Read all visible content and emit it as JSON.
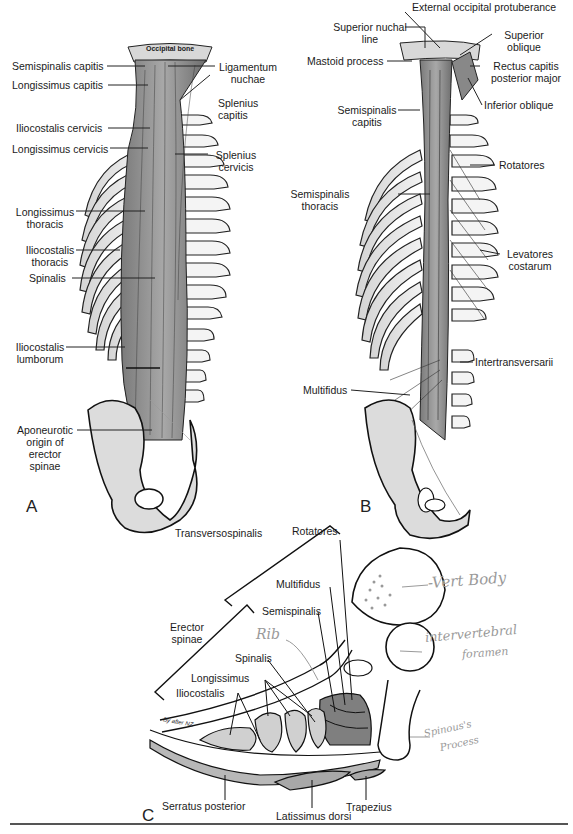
{
  "figure": {
    "panels": [
      {
        "id": "A",
        "letter": "A",
        "view": "posterior, superficial erector spinae",
        "labels": {
          "occipital_bone": "Occipital bone",
          "semispinalis_capitis": "Semispinalis capitis",
          "longissimus_capitis": "Longissimus capitis",
          "iliocostalis_cervicis": "Iliocostalis cervicis",
          "longissimus_cervicis": "Longissimus cervicis",
          "longissimus_thoracis_1": "Longissimus",
          "longissimus_thoracis_2": "thoracis",
          "iliocostalis_thoracis_1": "Iliocostalis",
          "iliocostalis_thoracis_2": "thoracis",
          "spinalis": "Spinalis",
          "iliocostalis_lumborum_1": "Iliocostalis",
          "iliocostalis_lumborum_2": "lumborum",
          "aponeurotic_1": "Aponeurotic",
          "aponeurotic_2": "origin of",
          "aponeurotic_3": "erector",
          "aponeurotic_4": "spinae",
          "ligamentum_nuchae_1": "Ligamentum",
          "ligamentum_nuchae_2": "nuchae",
          "splenius_capitis_1": "Splenius",
          "splenius_capitis_2": "capitis",
          "splenius_cervicis_1": "Splenius",
          "splenius_cervicis_2": "cervicis"
        }
      },
      {
        "id": "B",
        "letter": "B",
        "view": "posterior, deep transversospinal group",
        "labels": {
          "external_occipital_protuberance": "External occipital protuberance",
          "superior_nuchal_line_1": "Superior nuchal",
          "superior_nuchal_line_2": "line",
          "mastoid_process": "Mastoid process",
          "semispinalis_capitis_1": "Semispinalis",
          "semispinalis_capitis_2": "capitis",
          "semispinalis_thoracis_1": "Semispinalis",
          "semispinalis_thoracis_2": "thoracis",
          "multifidus": "Multifidus",
          "superior_oblique_1": "Superior",
          "superior_oblique_2": "oblique",
          "rectus_capitis_1": "Rectus capitis",
          "rectus_capitis_2": "posterior major",
          "inferior_oblique": "Inferior oblique",
          "rotatores": "Rotatores",
          "levatores_costarum_1": "Levatores",
          "levatores_costarum_2": "costarum",
          "intertransversarii": "Intertransversarii"
        }
      },
      {
        "id": "C",
        "letter": "C",
        "view": "transverse section",
        "labels": {
          "transversospinalis": "Transversospinalis",
          "rotatores": "Rotatores",
          "multifidus": "Multifidus",
          "semispinalis": "Semispinalis",
          "erector_spinae_1": "Erector",
          "erector_spinae_2": "spinae",
          "spinalis": "Spinalis",
          "longissimus": "Longissimus",
          "iliocostalis": "Iliocostalis",
          "serratus_posterior": "Serratus posterior",
          "latissimus_dorsi": "Latissimus dorsi",
          "trapezius": "Trapezius",
          "credit": "By after NZ"
        },
        "handwritten_notes": {
          "vert_body": "-Vert Body",
          "rib": "Rib",
          "intervertebral_1": "intervertebral",
          "intervertebral_2": "foramen",
          "spinous_1": "Spinous's",
          "spinous_2": "Process"
        }
      }
    ],
    "colors": {
      "muscle_fill": "#8f8f8f",
      "bone_fill": "#e6e6e6",
      "line": "#1a1a1a",
      "handwriting": "#9a9a9a"
    }
  }
}
